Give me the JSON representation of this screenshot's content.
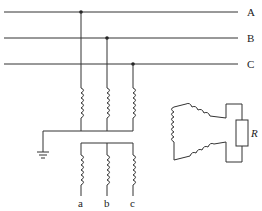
{
  "diagram": {
    "type": "three-phase voltage transformer (open-delta) circuit",
    "lines": [
      {
        "label": "A"
      },
      {
        "label": "B"
      },
      {
        "label": "C"
      }
    ],
    "secondary_terminals": [
      {
        "label": "a"
      },
      {
        "label": "b"
      },
      {
        "label": "c"
      }
    ],
    "resistor": {
      "label": "R"
    },
    "colors": {
      "stroke": "#333333",
      "background": "#ffffff"
    }
  }
}
